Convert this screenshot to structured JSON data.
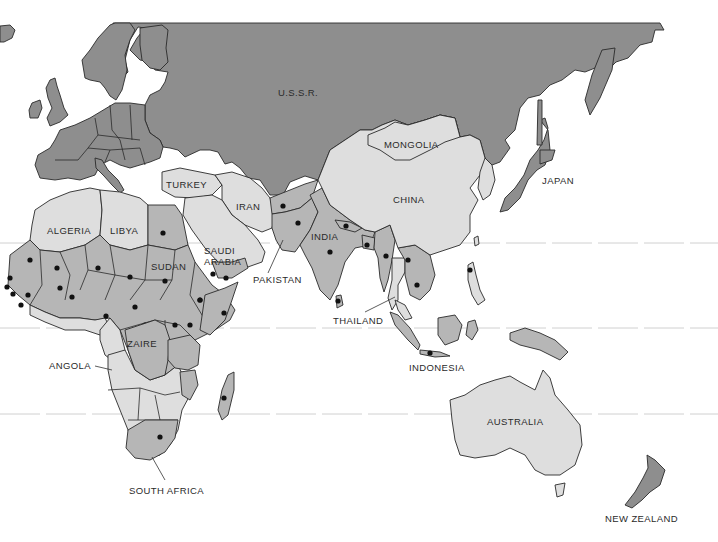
{
  "map": {
    "title": "",
    "region": "Eastern Hemisphere",
    "shading_levels": {
      "dark": "#8e8e8e",
      "medium": "#b6b6b6",
      "light": "#dedede",
      "water": "#ffffff",
      "marker": "#111111"
    },
    "labels": {
      "ussr": "U.S.S.R.",
      "mongolia": "MONGOLIA",
      "china": "CHINA",
      "japan": "JAPAN",
      "turkey": "TURKEY",
      "iran": "IRAN",
      "algeria": "ALGERIA",
      "libya": "LIBYA",
      "saudi_arabia_1": "SAUDI",
      "saudi_arabia_2": "ARABIA",
      "india": "INDIA",
      "pakistan": "PAKISTAN",
      "sudan": "SUDAN",
      "thailand": "THAILAND",
      "zaire": "ZAIRE",
      "angola": "ANGOLA",
      "indonesia": "INDONESIA",
      "australia": "AUSTRALIA",
      "south_africa": "SOUTH AFRICA",
      "new_zealand": "NEW ZEALAND"
    },
    "dots_count": 46
  }
}
